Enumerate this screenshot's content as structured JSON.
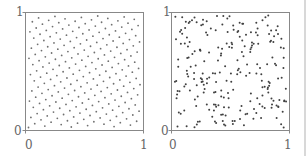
{
  "chart_data": [
    {
      "type": "scatter",
      "title": "",
      "xlabel": "",
      "ylabel": "",
      "xlim": [
        0,
        1
      ],
      "ylim": [
        0,
        1
      ],
      "x_ticks": [
        "0",
        "1"
      ],
      "y_ticks": [
        "0",
        "1"
      ],
      "grid": false,
      "description": "Rank-1 lattice point set (regular diagonal rows descending left to right)",
      "lattice": {
        "n": 233,
        "generator": 144
      },
      "point_color": "#707070"
    },
    {
      "type": "scatter",
      "title": "",
      "xlabel": "",
      "ylabel": "",
      "xlim": [
        0,
        1
      ],
      "ylim": [
        0,
        1
      ],
      "x_ticks": [
        "0",
        "1"
      ],
      "y_ticks": [
        "0",
        "1"
      ],
      "grid": false,
      "description": "Uniform random point set",
      "random": {
        "n": 233,
        "seed": 7
      },
      "point_color": "#404040"
    }
  ],
  "axes": {
    "left": {
      "x0": "0",
      "x1": "1",
      "y0": "0",
      "y1": "1"
    },
    "right": {
      "x0": "0",
      "x1": "1",
      "y0": "0",
      "y1": "1"
    }
  }
}
